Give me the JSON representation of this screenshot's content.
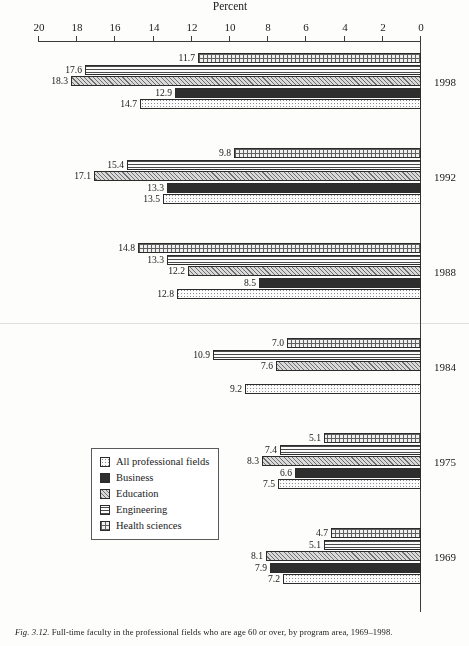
{
  "caption": {
    "figure_number": "Fig. 3.12.",
    "text": "Full-time faculty in the professional fields who are age 60 or over, by program area, 1969–1998."
  },
  "legend": {
    "items": [
      {
        "label": "All professional fields",
        "pattern": "light-dots"
      },
      {
        "label": "Business",
        "pattern": "solid-dark"
      },
      {
        "label": "Education",
        "pattern": "diagonal-hatch"
      },
      {
        "label": "Engineering",
        "pattern": "horizontal-lines"
      },
      {
        "label": "Health sciences",
        "pattern": "cross-hatch"
      }
    ]
  },
  "axis": {
    "value_title": "Percent",
    "ticks": [
      "0",
      "2",
      "4",
      "6",
      "8",
      "10",
      "12",
      "14",
      "16",
      "18",
      "20"
    ]
  },
  "chart_data": {
    "type": "bar",
    "orientation": "horizontal",
    "title": "Full-time faculty in the professional fields who are age 60 or over, by program area, 1969–1998.",
    "xlabel": "Percent",
    "ylabel": "",
    "xlim": [
      0,
      20
    ],
    "grid": false,
    "legend_position": "inside-left",
    "categories": [
      "1969",
      "1975",
      "1984",
      "1988",
      "1992",
      "1998"
    ],
    "series": [
      {
        "name": "All professional fields",
        "values": [
          7.2,
          7.5,
          9.2,
          12.8,
          13.5,
          14.7
        ]
      },
      {
        "name": "Business",
        "values": [
          7.9,
          6.6,
          null,
          8.5,
          13.3,
          12.9
        ]
      },
      {
        "name": "Education",
        "values": [
          8.1,
          8.3,
          7.6,
          12.2,
          17.1,
          18.3
        ]
      },
      {
        "name": "Engineering",
        "values": [
          5.1,
          7.4,
          10.9,
          13.3,
          15.4,
          17.6
        ]
      },
      {
        "name": "Health sciences",
        "values": [
          4.7,
          5.1,
          7.0,
          14.8,
          9.8,
          11.7
        ]
      }
    ],
    "data_labels": {
      "1969": {
        "All professional fields": "7.2",
        "Business": "7.9",
        "Education": "8.1",
        "Engineering": "5.1",
        "Health sciences": "4.7"
      },
      "1975": {
        "All professional fields": "7.5",
        "Business": "6.6",
        "Education": "8.3",
        "Engineering": "7.4",
        "Health sciences": "5.1"
      },
      "1984": {
        "All professional fields": "9.2",
        "Business": "",
        "Education": "7.6",
        "Engineering": "10.9",
        "Health sciences": "7.0"
      },
      "1988": {
        "All professional fields": "12.8",
        "Business": "8.5",
        "Education": "12.2",
        "Engineering": "13.3",
        "Health sciences": "14.8"
      },
      "1992": {
        "All professional fields": "13.5",
        "Business": "13.3",
        "Education": "17.1",
        "Engineering": "15.4",
        "Health sciences": "9.8"
      },
      "1998": {
        "All professional fields": "14.7",
        "Business": "12.9",
        "Education": "18.3",
        "Engineering": "17.6",
        "Health sciences": "11.7"
      }
    }
  }
}
